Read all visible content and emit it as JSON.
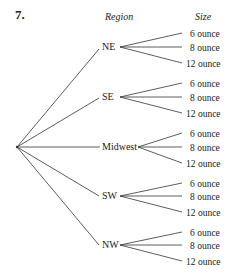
{
  "problem_number": "7.",
  "headers": {
    "region": "Region",
    "size": "Size"
  },
  "regions": [
    {
      "label": "NE",
      "sizes": [
        "6 ounce",
        "8 ounce",
        "12 ounce"
      ]
    },
    {
      "label": "SE",
      "sizes": [
        "6 ounce",
        "8 ounce",
        "12 ounce"
      ]
    },
    {
      "label": "Midwest",
      "sizes": [
        "6 ounce",
        "8 ounce",
        "12 ounce"
      ]
    },
    {
      "label": "SW",
      "sizes": [
        "6 ounce",
        "8 ounce",
        "12 ounce"
      ]
    },
    {
      "label": "NW",
      "sizes": [
        "6 ounce",
        "8 ounce",
        "12 ounce"
      ]
    }
  ],
  "colors": {
    "line": "#333333",
    "text": "#222222"
  }
}
